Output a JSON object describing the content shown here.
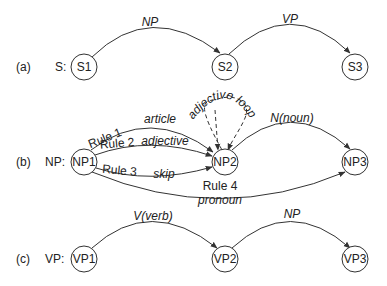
{
  "diagram": {
    "type": "augmented transition networks",
    "rows": [
      {
        "id": "a",
        "tag": "(a)",
        "name": "S:",
        "nodes": [
          "S1",
          "S2",
          "S3"
        ],
        "edges": [
          {
            "from": "S1",
            "to": "S2",
            "label": "NP"
          },
          {
            "from": "S2",
            "to": "S3",
            "label": "VP"
          }
        ]
      },
      {
        "id": "b",
        "tag": "(b)",
        "name": "NP:",
        "nodes": [
          "NP1",
          "NP2",
          "NP3"
        ],
        "edges": [
          {
            "from": "NP1",
            "to": "NP2",
            "rule": "Rule 1",
            "label": "article"
          },
          {
            "from": "NP1",
            "to": "NP2",
            "rule": "Rule 2",
            "label": "adjective"
          },
          {
            "from": "NP1",
            "to": "NP2",
            "rule": "Rule 3",
            "label": "skip"
          },
          {
            "from": "NP2",
            "to": "NP2",
            "label": "adjective loop",
            "style": "dashed"
          },
          {
            "from": "NP2",
            "to": "NP3",
            "label": "N(noun)"
          },
          {
            "from": "NP1",
            "to": "NP3",
            "rule": "Rule 4",
            "label": "pronoun"
          }
        ]
      },
      {
        "id": "c",
        "tag": "(c)",
        "name": "VP:",
        "nodes": [
          "VP1",
          "VP2",
          "VP3"
        ],
        "edges": [
          {
            "from": "VP1",
            "to": "VP2",
            "label": "V(verb)"
          },
          {
            "from": "VP2",
            "to": "VP3",
            "label": "NP"
          }
        ]
      }
    ]
  },
  "labels": {
    "a_tag": "(a)",
    "a_name": "S:",
    "s1": "S1",
    "s2": "S2",
    "s3": "S3",
    "e_np": "NP",
    "e_vp": "VP",
    "b_tag": "(b)",
    "b_name": "NP:",
    "np1": "NP1",
    "np2": "NP2",
    "np3": "NP3",
    "rule1": "Rule 1",
    "article": "article",
    "rule2": "Rule 2",
    "adjective": "adjective",
    "rule3": "Rule 3",
    "skip": "skip",
    "rule4": "Rule 4",
    "pronoun": "pronoun",
    "adj_loop": "adjective loop",
    "noun": "N(noun)",
    "c_tag": "(c)",
    "c_name": "VP:",
    "vp1": "VP1",
    "vp2": "VP2",
    "vp3": "VP3",
    "verb": "V(verb)",
    "vp_np": "NP"
  }
}
